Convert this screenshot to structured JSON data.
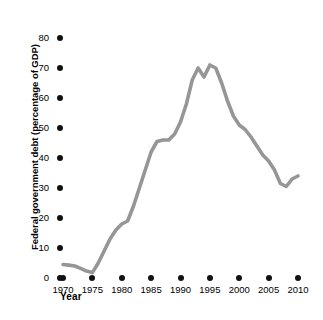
{
  "chart_data": {
    "type": "line",
    "title": "",
    "xlabel": "Year",
    "ylabel": "Federal government debt (percentage of GDP)",
    "xlim": [
      1968,
      2012
    ],
    "ylim": [
      0,
      83
    ],
    "grid": false,
    "legend": null,
    "line_color": "#969696",
    "tick_color": "#111111",
    "x_ticks": [
      "1970",
      "1975",
      "1980",
      "1985",
      "1990",
      "1995",
      "2000",
      "2005",
      "2010"
    ],
    "y_ticks": [
      "0",
      "10",
      "20",
      "30",
      "40",
      "50",
      "60",
      "70",
      "80"
    ],
    "series": [
      {
        "name": "Federal government debt (percentage of GDP)",
        "x": [
          1970,
          1971,
          1972,
          1973,
          1974,
          1975,
          1976,
          1977,
          1978,
          1979,
          1980,
          1981,
          1982,
          1983,
          1984,
          1985,
          1986,
          1987,
          1988,
          1989,
          1990,
          1991,
          1992,
          1993,
          1994,
          1995,
          1996,
          1997,
          1998,
          1999,
          2000,
          2001,
          2002,
          2003,
          2004,
          2005,
          2006,
          2007,
          2008,
          2009,
          2010
        ],
        "values": [
          4.5,
          4.3,
          4.0,
          3.2,
          2.3,
          1.8,
          5.0,
          9.0,
          13.0,
          16.0,
          18.0,
          19.0,
          24.0,
          30.0,
          36.0,
          42.0,
          45.5,
          46.0,
          46.0,
          48.0,
          52.0,
          58.0,
          66.0,
          70.0,
          67.0,
          71.0,
          70.0,
          65.0,
          59.0,
          54.0,
          51.0,
          49.5,
          47.0,
          44.0,
          41.0,
          39.0,
          36.0,
          31.5,
          30.5,
          33.0,
          34.0
        ]
      }
    ]
  },
  "axes": {
    "y_title": "Federal government debt (percentage of GDP)",
    "x_title": "Year"
  }
}
